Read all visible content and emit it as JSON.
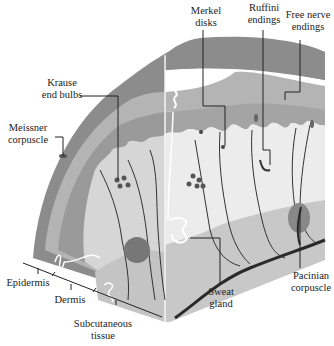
{
  "figure": {
    "colors": {
      "epidermis_outer": "#8c8c8c",
      "epidermis_band": "#b4b4b4",
      "epidermis_inner": "#9a9a9a",
      "dermis": "#d6d6d6",
      "dermis_front": "#ececec",
      "subcutaneous": "#c4c4c4",
      "nerve": "#2a2a2a",
      "background": "#ffffff"
    }
  },
  "labels": {
    "krause": {
      "line1": "Krause",
      "line2": "end bulbs"
    },
    "meissner": {
      "line1": "Meissner",
      "line2": "corpuscle"
    },
    "merkel": {
      "line1": "Merkel",
      "line2": "disks"
    },
    "ruffini": {
      "line1": "Ruffini",
      "line2": "endings"
    },
    "free_nerve": {
      "line1": "Free nerve",
      "line2": "endings"
    },
    "pacinian": {
      "line1": "Pacinian",
      "line2": "corpuscle"
    },
    "sweat": {
      "line1": "Sweat",
      "line2": "gland"
    },
    "epidermis": {
      "line1": "Epidermis"
    },
    "dermis": {
      "line1": "Dermis"
    },
    "subcutaneous": {
      "line1": "Subcutaneous",
      "line2": "tissue"
    }
  }
}
